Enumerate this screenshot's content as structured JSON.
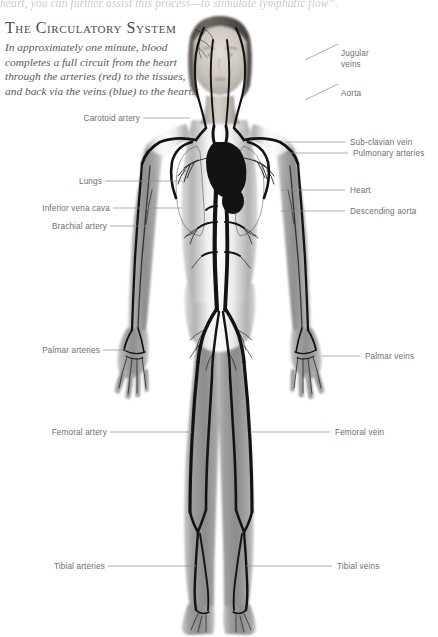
{
  "page": {
    "running_head": "heart, you can further assist this process—to stimulate lymphatic flow”.",
    "background_color": "#ffffff"
  },
  "article": {
    "title": "The Circulatory System",
    "intro": "In approximately one minute, blood completes a full circuit from the heart through the arteries (red) to the tissues, and back via the veins (blue) to the heart."
  },
  "diagram": {
    "colors": {
      "vessel": "#111111",
      "body": "#9a9a9a",
      "leader_line": "#8d8c91",
      "label_text": "#6f6e73",
      "title_text": "#4b4a50"
    },
    "labels_right": [
      {
        "id": "jugular-veins",
        "text": "Jugular\nveins",
        "line1": "Jugular",
        "line2": "veins"
      },
      {
        "id": "aorta",
        "text": "Aorta"
      },
      {
        "id": "sub-clavian-vein",
        "text": "Sub-clavian vein"
      },
      {
        "id": "pulmonary-arteries",
        "text": "Pulmonary arteries"
      },
      {
        "id": "heart",
        "text": "Heart"
      },
      {
        "id": "descending-aorta",
        "text": "Descending aorta"
      },
      {
        "id": "palmar-veins",
        "text": "Palmar veins"
      },
      {
        "id": "femoral-vein",
        "text": "Femoral vein"
      },
      {
        "id": "tibial-veins",
        "text": "Tibial veins"
      }
    ],
    "labels_left": [
      {
        "id": "carotoid-artery",
        "text": "Carotoid artery"
      },
      {
        "id": "lungs",
        "text": "Lungs"
      },
      {
        "id": "inferior-vena-cava",
        "text": "Inferior vena cava"
      },
      {
        "id": "brachial-artery",
        "text": "Brachial artery"
      },
      {
        "id": "palmar-arteries",
        "text": "Palmar arteries"
      },
      {
        "id": "femoral-artery",
        "text": "Femoral artery"
      },
      {
        "id": "tibial-arteries",
        "text": "Tibial arteries"
      }
    ]
  }
}
